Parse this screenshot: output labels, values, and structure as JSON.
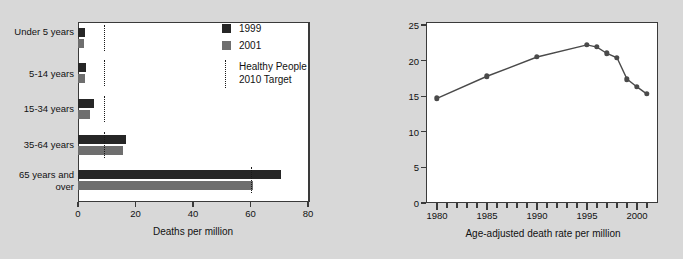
{
  "figure": {
    "background_color": "#d8d8d8",
    "panel_color": "#ffffff"
  },
  "left_chart": {
    "xlabel": "Deaths per million",
    "categories": [
      "Under\n5 years",
      "5-14 years",
      "15-34 years",
      "35-64 years",
      "65 years\nand over"
    ],
    "xticks": [
      "0",
      "20",
      "40",
      "60",
      "80"
    ],
    "legend": {
      "series_1_label": "1999",
      "series_2_label": "2001",
      "series_1_color": "#262626",
      "series_2_color": "#6e6e6e",
      "target_label": "Healthy People\n2010 Target"
    }
  },
  "right_chart": {
    "xlabel": "Age-adjusted death rate per million",
    "yticks": [
      "0",
      "5",
      "10",
      "15",
      "20",
      "25"
    ],
    "xticks": [
      "1980",
      "1985",
      "1990",
      "1995",
      "2000"
    ]
  },
  "chart_data": [
    {
      "type": "bar",
      "orientation": "horizontal",
      "title": "",
      "xlabel": "Deaths per million",
      "ylabel": "",
      "xlim": [
        0,
        80
      ],
      "xticks": [
        0,
        20,
        40,
        60,
        80
      ],
      "grid": false,
      "legend_position": "upper-right-inside",
      "categories": [
        "Under 5 years",
        "5-14 years",
        "15-34 years",
        "35-64 years",
        "65 years and over"
      ],
      "series": [
        {
          "name": "1999",
          "color": "#262626",
          "values": [
            2.3,
            2.9,
            5.4,
            16.6,
            70.5
          ]
        },
        {
          "name": "2001",
          "color": "#6e6e6e",
          "values": [
            2.0,
            2.3,
            4.3,
            15.7,
            61.0
          ]
        }
      ],
      "annotations": [
        {
          "name": "Healthy People 2010 Target",
          "style": "dotted-vertical-line",
          "values": [
            9.0,
            9.0,
            9.0,
            9.0,
            60.3
          ]
        }
      ]
    },
    {
      "type": "line",
      "title": "",
      "xlabel": "Age-adjusted death rate per million",
      "ylabel": "",
      "xlim": [
        1979,
        2002
      ],
      "ylim": [
        0,
        25
      ],
      "yticks": [
        0,
        5,
        10,
        15,
        20,
        25
      ],
      "xticks": [
        1980,
        1985,
        1990,
        1995,
        2000
      ],
      "grid": false,
      "marker": "circle",
      "series": [
        {
          "name": "Age-adjusted death rate per million",
          "color": "#4a4a4a",
          "x": [
            1980,
            1985,
            1990,
            1995,
            1996,
            1997,
            1998,
            1999,
            2000,
            2001
          ],
          "values": [
            14.7,
            17.8,
            20.5,
            22.2,
            21.9,
            21.0,
            20.4,
            17.4,
            16.3,
            15.3
          ]
        }
      ]
    }
  ]
}
